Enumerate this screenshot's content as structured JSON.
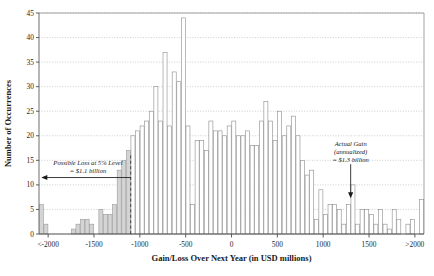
{
  "chart_data": {
    "type": "bar",
    "title": "",
    "xlabel": "Gain/Loss Over Next Year (in USD millions)",
    "ylabel": "Number of Occurrences",
    "ylim": [
      0,
      45
    ],
    "ytick_step": 5,
    "yticks": [
      "0",
      "5",
      "10",
      "15",
      "20",
      "25",
      "30",
      "35",
      "40",
      "45"
    ],
    "xticks": [
      "<-2000",
      "-1500",
      "-1000",
      "-500",
      "0",
      "500",
      "1000",
      "1500",
      ">2000"
    ],
    "xtick_values": [
      -2000,
      -1500,
      -1000,
      -500,
      0,
      500,
      1000,
      1500,
      2000
    ],
    "xlim": [
      -2100,
      2100
    ],
    "bin_width": 50,
    "grid": "horizontal-dotted",
    "legend": "none",
    "categories": [
      -2075,
      -2025,
      -1975,
      -1925,
      -1875,
      -1825,
      -1775,
      -1725,
      -1675,
      -1625,
      -1575,
      -1525,
      -1475,
      -1425,
      -1375,
      -1325,
      -1275,
      -1225,
      -1175,
      -1125,
      -1075,
      -1025,
      -975,
      -925,
      -875,
      -825,
      -775,
      -725,
      -675,
      -625,
      -575,
      -525,
      -475,
      -425,
      -375,
      -325,
      -275,
      -225,
      -175,
      -125,
      -75,
      -25,
      25,
      75,
      125,
      175,
      225,
      275,
      325,
      375,
      425,
      475,
      525,
      575,
      625,
      675,
      725,
      775,
      825,
      875,
      925,
      975,
      1025,
      1075,
      1125,
      1175,
      1225,
      1275,
      1325,
      1375,
      1425,
      1475,
      1525,
      1575,
      1625,
      1675,
      1725,
      1775,
      1825,
      1875,
      1925,
      1975,
      2075
    ],
    "values": [
      6,
      2,
      0,
      0,
      0,
      0,
      0,
      1,
      2,
      3,
      3,
      2,
      0,
      5,
      4,
      4,
      6,
      13,
      15,
      17,
      20,
      21,
      22,
      23,
      25,
      30,
      23,
      37,
      22,
      33,
      31,
      44,
      22,
      6,
      19,
      19,
      17,
      23,
      21,
      21,
      20,
      22,
      23,
      20,
      20,
      21,
      18,
      18,
      23,
      27,
      23,
      19,
      25,
      20,
      22,
      24,
      20,
      15,
      12,
      13,
      3,
      9,
      4,
      6,
      6,
      5,
      2,
      6,
      10,
      2,
      5,
      5,
      4,
      2,
      5,
      2,
      1,
      5,
      3,
      0,
      2,
      3,
      7
    ],
    "shaded_threshold": -1100,
    "shaded_note": "bars at or below the 5% VaR threshold are gray-filled; bars above it are unfilled (white)",
    "annotations": [
      {
        "name": "possible-loss",
        "lines": [
          "Possible Loss at 5% Level",
          "= $1.1 billion"
        ],
        "arrow": "left",
        "arrow_from": -1100,
        "arrow_to": -2075,
        "arrow_y": 11.5
      },
      {
        "name": "actual-gain",
        "lines": [
          "Actual Gain",
          "(annualized)",
          "= $1.3 billion"
        ],
        "arrow": "down",
        "arrow_x": 1300,
        "arrow_from_y": 14.2,
        "arrow_to_y": 7.3
      }
    ]
  }
}
